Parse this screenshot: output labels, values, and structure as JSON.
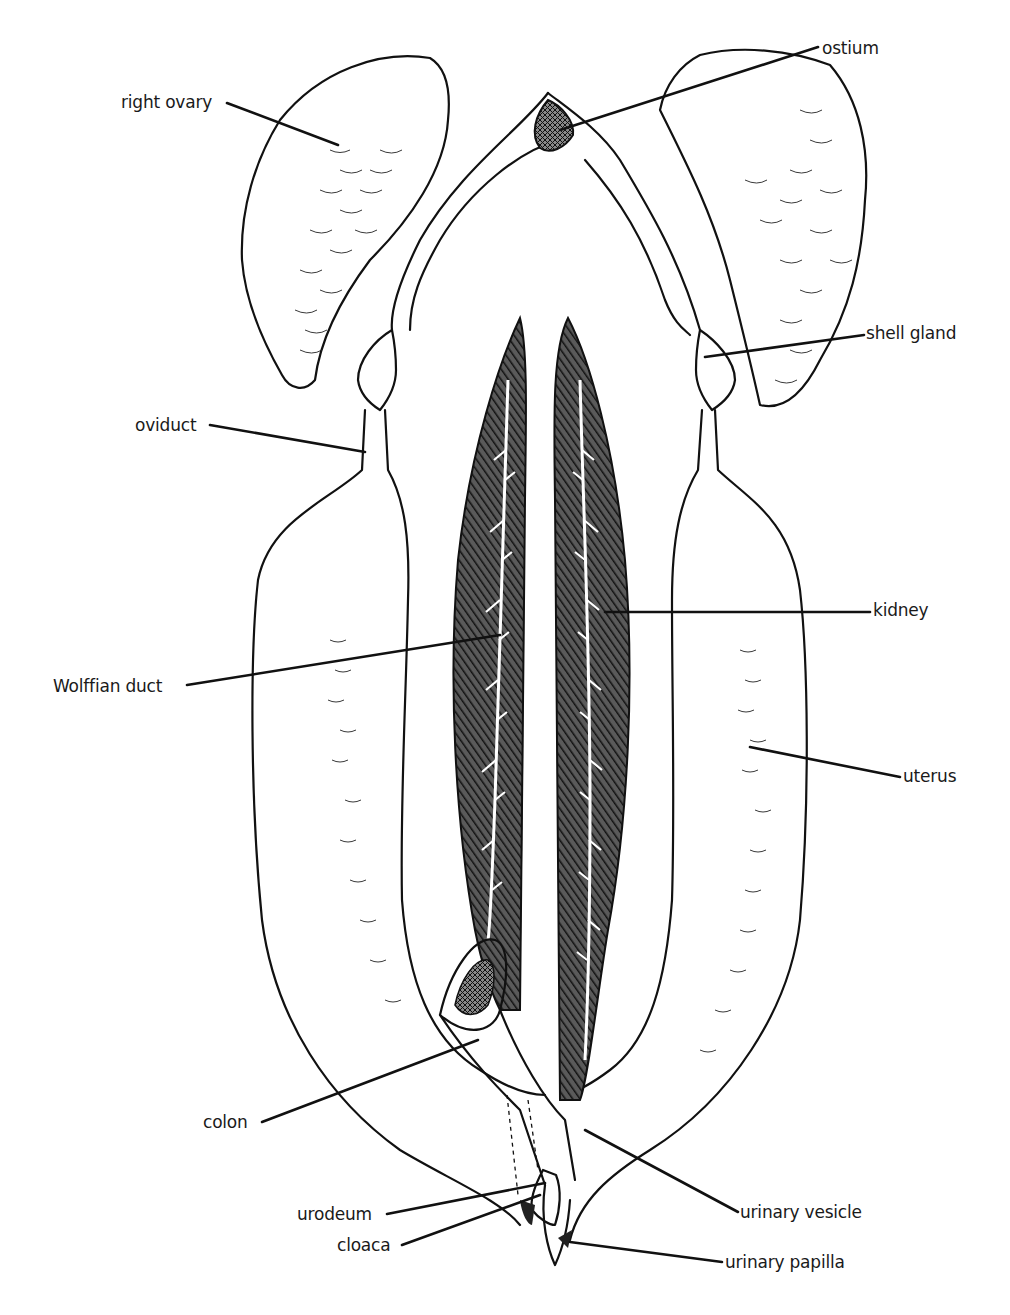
{
  "diagram": {
    "colors": {
      "ink": "#111111",
      "background": "#ffffff"
    },
    "labels": [
      {
        "id": "right-ovary",
        "text": "right ovary",
        "x": 121,
        "y": 92,
        "side": "left"
      },
      {
        "id": "ostium",
        "text": "ostium",
        "x": 822,
        "y": 38,
        "side": "right"
      },
      {
        "id": "shell-gland",
        "text": "shell gland",
        "x": 866,
        "y": 323,
        "side": "right"
      },
      {
        "id": "oviduct",
        "text": "oviduct",
        "x": 135,
        "y": 415,
        "side": "left"
      },
      {
        "id": "kidney",
        "text": "kidney",
        "x": 873,
        "y": 600,
        "side": "right"
      },
      {
        "id": "wolffian-duct",
        "text": "Wolffian duct",
        "x": 53,
        "y": 681,
        "side": "left"
      },
      {
        "id": "uterus",
        "text": "uterus",
        "x": 903,
        "y": 766,
        "side": "right"
      },
      {
        "id": "colon",
        "text": "colon",
        "x": 203,
        "y": 1112,
        "side": "left"
      },
      {
        "id": "urodeum",
        "text": "urodeum",
        "x": 297,
        "y": 1204,
        "side": "left"
      },
      {
        "id": "cloaca",
        "text": "cloaca",
        "x": 337,
        "y": 1237,
        "side": "left"
      },
      {
        "id": "urinary-vesicle",
        "text": "urinary vesicle",
        "x": 740,
        "y": 1204,
        "side": "right"
      },
      {
        "id": "urinary-papilla",
        "text": "urinary papilla",
        "x": 725,
        "y": 1252,
        "side": "right"
      }
    ]
  }
}
